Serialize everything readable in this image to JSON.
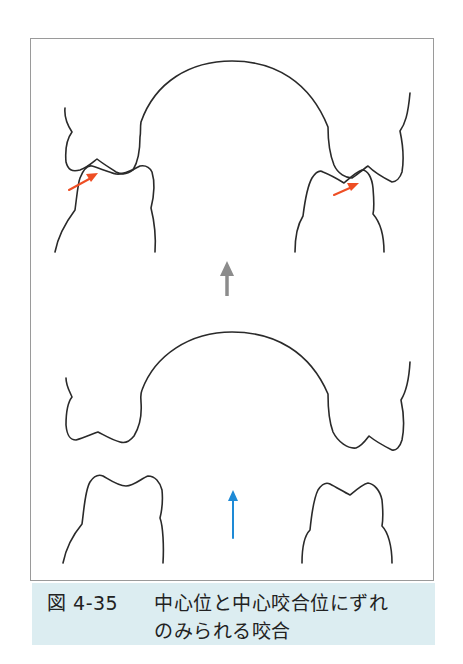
{
  "figure": {
    "label": "図 4-35",
    "caption_line1": "中心位と中心咬合位にずれ",
    "caption_line2": "のみられる咬合",
    "colors": {
      "outline": "#2a2a2a",
      "frame": "#9a9a9a",
      "contact_arrow": "#ee4e24",
      "closing_arrow_top": "#8c8c8c",
      "closing_arrow_bottom": "#1e8ad6",
      "caption_bg": "#dcedf1"
    },
    "panels": [
      {
        "name": "occluded-state",
        "arrows": [
          "contact-arrow-left",
          "contact-arrow-right",
          "gray-up-arrow"
        ]
      },
      {
        "name": "open-state",
        "arrows": [
          "blue-up-arrow"
        ]
      }
    ]
  }
}
